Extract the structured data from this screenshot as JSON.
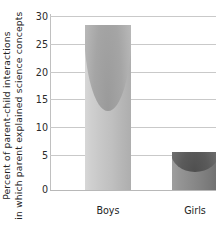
{
  "chart_data": {
    "type": "bar",
    "title": "",
    "subtitle": "",
    "categories": [
      "Boys",
      "Girls"
    ],
    "values": [
      28.5,
      6.5
    ],
    "series": [
      {
        "name": "Percent of parent-child interactions in which parent explained science concepts",
        "values": [
          28.5,
          6.5
        ]
      }
    ],
    "xlabel": "",
    "ylabel_line1": "Percent of parent-child interactions",
    "ylabel_line2": "in which parent explained science concepts",
    "ylim": [
      0,
      30
    ],
    "yticks": [
      0,
      5,
      10,
      15,
      20,
      25,
      30
    ],
    "ytick_labels": [
      "0",
      "5",
      "10",
      "15",
      "20",
      "25",
      "30"
    ],
    "grid": true,
    "grid_axis": "y",
    "legend": false,
    "legend_position": "none",
    "bar_style": "3d-cylinder",
    "colors": {
      "bar_boys": "#c0c0c0",
      "bar_girls": "#888888",
      "gridline": "#c9c9c9",
      "axis": "#c0c0c0",
      "text": "#242424",
      "background": "#ffffff"
    }
  }
}
